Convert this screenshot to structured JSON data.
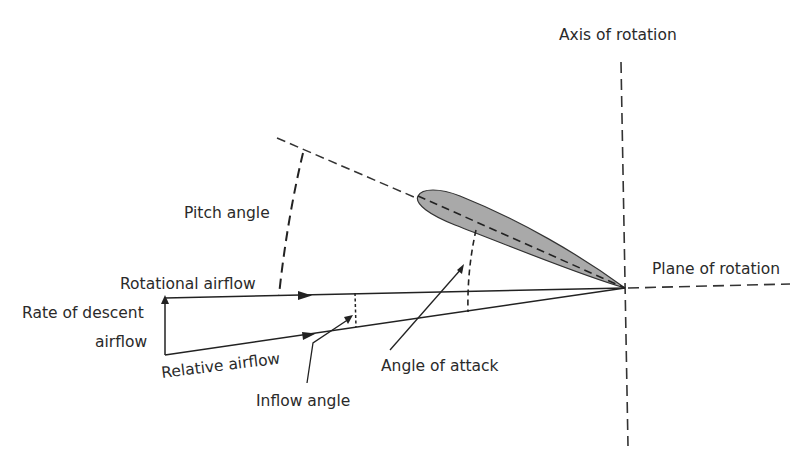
{
  "diagram": {
    "type": "rotor-blade-airflow-vector-diagram",
    "labels": {
      "axis_of_rotation": "Axis of rotation",
      "plane_of_rotation": "Plane of rotation",
      "pitch_angle": "Pitch angle",
      "rotational_airflow": "Rotational airflow",
      "rate_of_descent_line1": "Rate of descent",
      "rate_of_descent_line2": "airflow",
      "relative_airflow": "Relative airflow",
      "inflow_angle": "Inflow angle",
      "angle_of_attack": "Angle of attack"
    },
    "colors": {
      "line": "#222222",
      "airfoil_fill": "#a9a9a9",
      "text": "#2a2a2a",
      "background": "#ffffff"
    }
  }
}
